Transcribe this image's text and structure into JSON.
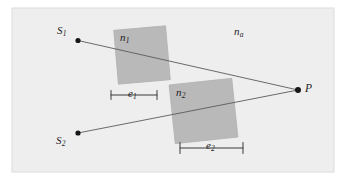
{
  "figure": {
    "caption_labels": {
      "source_1": "S",
      "source_1_sub": "1",
      "source_2": "S",
      "source_2_sub": "2",
      "point_p": "P",
      "medium_ambient": "n",
      "medium_ambient_sub": "a",
      "medium_1": "n",
      "medium_1_sub": "1",
      "medium_2": "n",
      "medium_2_sub": "2",
      "extent_1": "e",
      "extent_1_sub": "1",
      "extent_2": "e",
      "extent_2_sub": "2"
    },
    "colors": {
      "background": "#ffffff",
      "panel": "#eeeeee",
      "panel_border": "#d8d8d8",
      "block_fill": "#b9b9b9",
      "block_stroke": "#b0b0b0",
      "ray": "#5a5a5a",
      "marker": "#3a3a3a",
      "dot": "#171717",
      "text": "#1d1d1d"
    },
    "panel": {
      "x": 12,
      "y": 8,
      "width": 322,
      "height": 164
    },
    "points": {
      "S1": {
        "x": 78,
        "y": 40.5
      },
      "S2": {
        "x": 78,
        "y": 133
      },
      "P": {
        "x": 298,
        "y": 90
      }
    },
    "rays": [
      {
        "name": "ray-s1-p",
        "x1": 78,
        "y1": 40.5,
        "x2": 298,
        "y2": 90
      },
      {
        "name": "ray-s2-p",
        "x1": 78,
        "y1": 133,
        "x2": 298,
        "y2": 90
      }
    ],
    "blocks": [
      {
        "name": "block-n1",
        "cx": 142,
        "cy": 55,
        "width": 52,
        "height": 54,
        "rotation": -5
      },
      {
        "name": "block-n2",
        "cx": 203.5,
        "cy": 111,
        "width": 63,
        "height": 59,
        "rotation": -6
      }
    ],
    "dimension_markers": [
      {
        "name": "dimension-e1",
        "x1": 111,
        "x2": 157,
        "y": 95,
        "tick_half": 4.5
      },
      {
        "name": "dimension-e2",
        "x1": 180,
        "x2": 243,
        "y": 148,
        "tick_half": 5.5
      }
    ]
  }
}
